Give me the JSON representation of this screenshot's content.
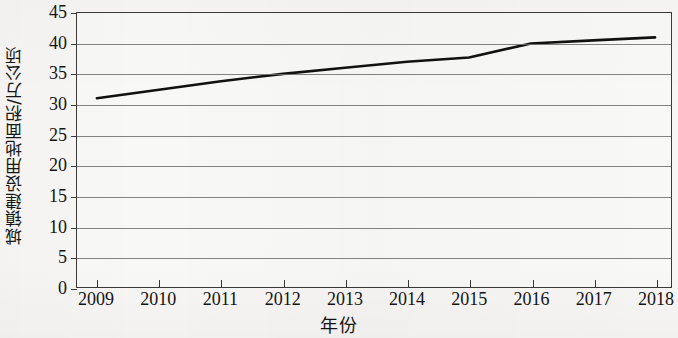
{
  "chart_data": {
    "type": "line",
    "title": "",
    "xlabel": "年份",
    "ylabel": "城镇建设用地面积/万公顷",
    "x": [
      2009,
      2010,
      2011,
      2012,
      2013,
      2014,
      2015,
      2016,
      2017,
      2018
    ],
    "xtick_labels": [
      "2009",
      "2010",
      "2011",
      "2012",
      "2013",
      "2014",
      "2015",
      "2016",
      "2017",
      "2018"
    ],
    "values": [
      31,
      32.4,
      33.8,
      35,
      36,
      37,
      37.7,
      40,
      40.5,
      41
    ],
    "series": [
      {
        "name": "城镇建设用地面积",
        "values": [
          31,
          32.4,
          33.8,
          35,
          36,
          37,
          37.7,
          40,
          40.5,
          41
        ]
      }
    ],
    "ylim": [
      0,
      45
    ],
    "xlim": [
      2009,
      2018
    ],
    "ytick_labels": [
      "0",
      "5",
      "10",
      "15",
      "20",
      "25",
      "30",
      "35",
      "40",
      "45"
    ],
    "yticks": [
      0,
      5,
      10,
      15,
      20,
      25,
      30,
      35,
      40,
      45
    ],
    "grid": "horizontal",
    "legend": "none",
    "line_color": "#111111",
    "grid_color": "#6e6e6e",
    "axis_color": "#3a3a3a",
    "background_color": "#f7f6f4"
  }
}
